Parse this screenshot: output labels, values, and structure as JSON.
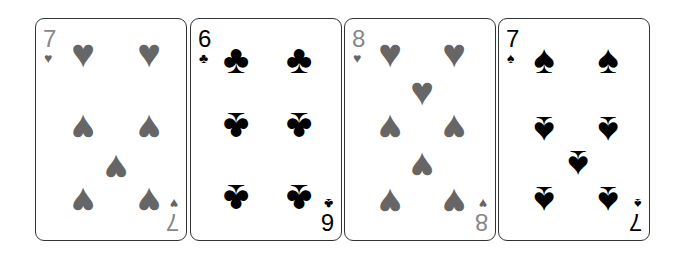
{
  "cards": [
    {
      "rank": "7",
      "suit": "hearts",
      "symbol": "♥",
      "color": "#666666"
    },
    {
      "rank": "6",
      "suit": "clubs",
      "symbol": "♣",
      "color": "#000000"
    },
    {
      "rank": "8",
      "suit": "hearts",
      "symbol": "♥",
      "color": "#666666"
    },
    {
      "rank": "7",
      "suit": "spades",
      "symbol": "♠",
      "color": "#000000"
    }
  ]
}
